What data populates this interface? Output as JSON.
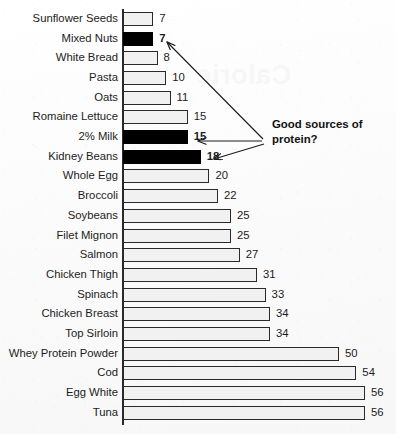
{
  "chart_data": {
    "type": "bar",
    "orientation": "horizontal",
    "title": "",
    "xlabel": "",
    "ylabel": "",
    "xlim": [
      0,
      56
    ],
    "grid": false,
    "legend": null,
    "categories": [
      "Sunflower Seeds",
      "Mixed Nuts",
      "White Bread",
      "Pasta",
      "Oats",
      "Romaine Lettuce",
      "2% Milk",
      "Kidney Beans",
      "Whole Egg",
      "Broccoli",
      "Soybeans",
      "Filet Mignon",
      "Salmon",
      "Chicken Thigh",
      "Spinach",
      "Chicken Breast",
      "Top Sirloin",
      "Whey Protein Powder",
      "Cod",
      "Egg White",
      "Tuna"
    ],
    "values": [
      7,
      7,
      8,
      10,
      11,
      15,
      15,
      18,
      20,
      22,
      25,
      25,
      27,
      31,
      33,
      34,
      34,
      50,
      54,
      56,
      56
    ],
    "highlighted": [
      false,
      true,
      false,
      false,
      false,
      false,
      true,
      true,
      false,
      false,
      false,
      false,
      false,
      false,
      false,
      false,
      false,
      false,
      false,
      false,
      false
    ],
    "bar_fill_color": "#f1f1f1",
    "bar_highlight_color": "#000000",
    "bar_border_color": "#2a2a2a"
  },
  "annotation": {
    "text": "Good sources of protein?",
    "line1": "Good sources of",
    "line2": "protein?",
    "points_to": [
      "Mixed Nuts",
      "2% Milk",
      "Kidney Beans"
    ]
  },
  "watermark": {
    "text": "Calorie"
  }
}
